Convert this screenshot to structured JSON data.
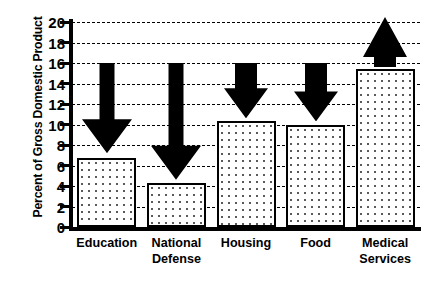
{
  "chart_data": {
    "type": "bar",
    "title": "",
    "subtitle": "",
    "xlabel": "",
    "ylabel": "Percent of Gross Domestic Product",
    "categories": [
      "Education",
      "National Defense",
      "Housing",
      "Food",
      "Medical Services"
    ],
    "category_lines": [
      [
        "Education"
      ],
      [
        "National",
        "Defense"
      ],
      [
        "Housing"
      ],
      [
        "Food"
      ],
      [
        "Medical",
        "Services"
      ]
    ],
    "values": [
      6.7,
      4.3,
      10.3,
      10.0,
      15.4
    ],
    "ylim": [
      0,
      20
    ],
    "ytick_step": 2,
    "ytick_labels": [
      "20",
      "18",
      "16",
      "14",
      "12",
      "10",
      "8",
      "6",
      "4",
      "2",
      "0"
    ],
    "ytick_values": [
      20,
      18,
      16,
      14,
      12,
      10,
      8,
      6,
      4,
      2,
      0
    ],
    "grid": true,
    "grid_style": "dashed-horizontal",
    "legend": null,
    "bar_fill": "#ffffff",
    "bar_dot_color": "#5a5a5a",
    "bar_edge_color": "#000000",
    "annotations": [
      {
        "name": "education-down-arrow",
        "category": "Education",
        "direction": "down",
        "from": 16.0,
        "to": 7.2,
        "style": "long-thin-shaft"
      },
      {
        "name": "defense-down-arrow",
        "category": "National Defense",
        "direction": "down",
        "from": 16.0,
        "to": 4.6,
        "style": "long-thin-shaft"
      },
      {
        "name": "housing-down-arrow",
        "category": "Housing",
        "direction": "down",
        "from": 16.0,
        "to": 10.6,
        "style": "short-wide"
      },
      {
        "name": "food-down-arrow",
        "category": "Food",
        "direction": "down",
        "from": 16.0,
        "to": 10.3,
        "style": "short-wide"
      },
      {
        "name": "medical-up-arrow",
        "category": "Medical Services",
        "direction": "up",
        "from": 15.6,
        "to": 20.5,
        "style": "short-wide"
      }
    ]
  },
  "axis": {
    "y_title": "Percent of Gross Domestic Product"
  }
}
